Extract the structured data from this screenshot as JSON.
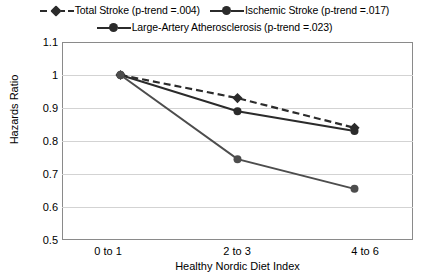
{
  "chart_data": {
    "type": "line",
    "title": "",
    "xlabel": "Healthy Nordic Diet Index",
    "ylabel": "Hazards Ratio",
    "categories": [
      "0 to 1",
      "2 to 3",
      "4 to 6"
    ],
    "ylim": [
      0.5,
      1.1
    ],
    "yticks": [
      "0.5",
      "0.6",
      "0.7",
      "0.8",
      "0.9",
      "1",
      "1.1"
    ],
    "ytick_values": [
      0.5,
      0.6,
      0.7,
      0.8,
      0.9,
      1.0,
      1.1
    ],
    "grid": true,
    "legend_position": "top",
    "series": [
      {
        "name": "Total Stroke (p-trend =.004)",
        "values": [
          1.0,
          0.93,
          0.84
        ],
        "style": "dashed",
        "marker": "diamond",
        "color": "#2b2b2b"
      },
      {
        "name": "Ischemic Stroke (p-trend =.017)",
        "values": [
          1.0,
          0.89,
          0.83
        ],
        "style": "solid",
        "marker": "circle",
        "color": "#2b2b2b"
      },
      {
        "name": "Large-Artery Atherosclerosis (p-trend =.023)",
        "values": [
          1.0,
          0.745,
          0.655
        ],
        "style": "solid",
        "marker": "circle",
        "color": "#4d4d4d"
      }
    ]
  },
  "legend": {
    "row1": [
      {
        "label": "Total Stroke (p-trend =.004)"
      },
      {
        "label": "Ischemic Stroke (p-trend =.017)"
      }
    ],
    "row2": [
      {
        "label": "Large-Artery Atherosclerosis (p-trend =.023)"
      }
    ]
  },
  "axes": {
    "y_title": "Hazards Ratio",
    "x_title": "Healthy Nordic Diet Index",
    "y_ticks": [
      "1.1",
      "1",
      "0.9",
      "0.8",
      "0.7",
      "0.6",
      "0.5"
    ],
    "x_ticks": [
      "0 to 1",
      "2 to 3",
      "4 to 6"
    ]
  }
}
